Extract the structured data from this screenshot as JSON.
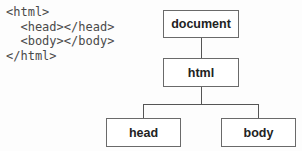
{
  "code": {
    "lines": [
      "<html>",
      "  <head></head>",
      "  <body></body>",
      "</html>"
    ]
  },
  "tree": {
    "root": {
      "label": "document"
    },
    "html": {
      "label": "html"
    },
    "children": [
      {
        "label": "head"
      },
      {
        "label": "body"
      }
    ]
  }
}
